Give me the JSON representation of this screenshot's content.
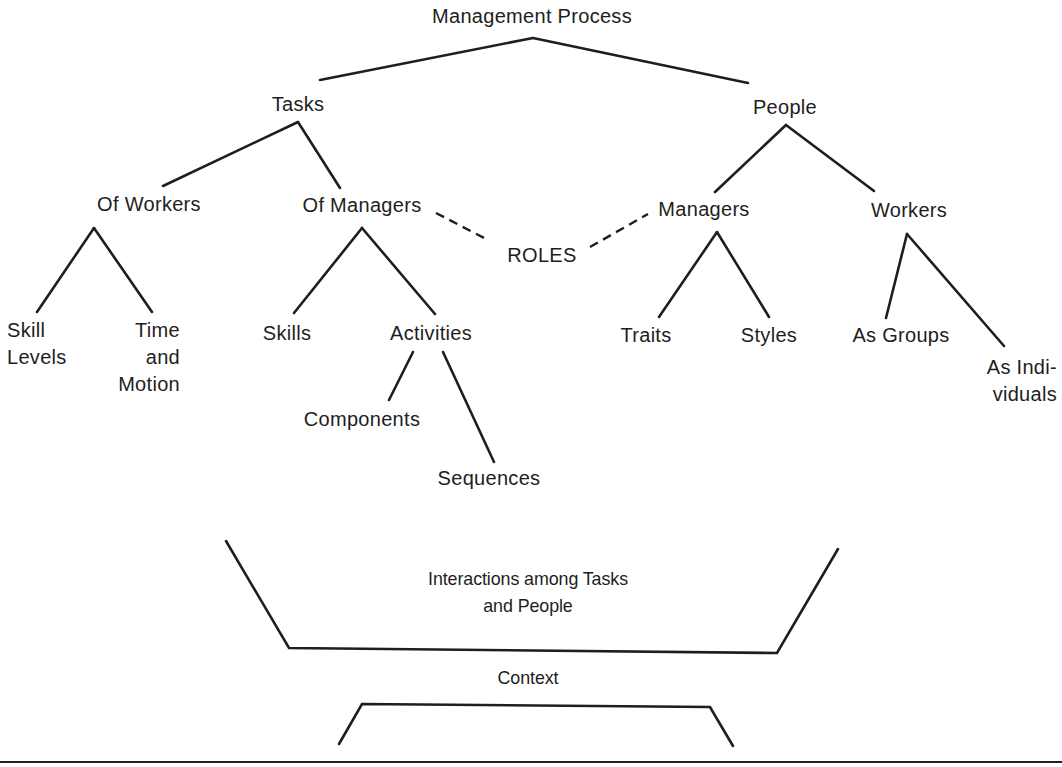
{
  "diagram": {
    "type": "tree",
    "colors": {
      "line": "#1e1e1e",
      "text": "#1e1e1e",
      "background": "#ffffff"
    },
    "root": {
      "label": "Management Process"
    },
    "level1": {
      "tasks": {
        "label": "Tasks"
      },
      "people": {
        "label": "People"
      }
    },
    "level2": {
      "of_workers": {
        "label": "Of Workers"
      },
      "of_managers": {
        "label": "Of Managers"
      },
      "managers": {
        "label": "Managers"
      },
      "workers": {
        "label": "Workers"
      }
    },
    "roles": {
      "label": "ROLES"
    },
    "level3": {
      "skill_levels": {
        "label": "Skill\nLevels"
      },
      "time_motion": {
        "label": "Time\nand\nMotion"
      },
      "skills": {
        "label": "Skills"
      },
      "activities": {
        "label": "Activities"
      },
      "traits": {
        "label": "Traits"
      },
      "styles": {
        "label": "Styles"
      },
      "as_groups": {
        "label": "As Groups"
      },
      "as_individuals": {
        "label": "As Indi-\nviduals"
      }
    },
    "level4": {
      "components": {
        "label": "Components"
      },
      "sequences": {
        "label": "Sequences"
      }
    },
    "interactions": {
      "label": "Interactions among Tasks\nand People"
    },
    "context": {
      "label": "Context"
    },
    "edges": [
      [
        "Management Process",
        "Tasks"
      ],
      [
        "Management Process",
        "People"
      ],
      [
        "Tasks",
        "Of Workers"
      ],
      [
        "Tasks",
        "Of Managers"
      ],
      [
        "People",
        "Managers"
      ],
      [
        "People",
        "Workers"
      ],
      [
        "Of Workers",
        "Skill Levels"
      ],
      [
        "Of Workers",
        "Time and Motion"
      ],
      [
        "Of Managers",
        "Skills"
      ],
      [
        "Of Managers",
        "Activities"
      ],
      [
        "Activities",
        "Components"
      ],
      [
        "Activities",
        "Sequences"
      ],
      [
        "Managers",
        "Traits"
      ],
      [
        "Managers",
        "Styles"
      ],
      [
        "Workers",
        "As Groups"
      ],
      [
        "Workers",
        "As Individuals"
      ]
    ],
    "dashed_edges": [
      [
        "Of Managers",
        "ROLES"
      ],
      [
        "ROLES",
        "Managers"
      ]
    ]
  }
}
